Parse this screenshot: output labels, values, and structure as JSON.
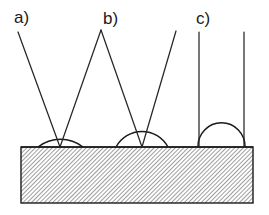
{
  "figure": {
    "background_color": "#ffffff",
    "line_color": "#1a1a1a",
    "hatch_color": "#555555",
    "substrate": {
      "x": 21,
      "y": 147,
      "width": 232,
      "height": 56,
      "hatch_angle_deg": 45,
      "hatch_spacing": 3
    },
    "panels": [
      {
        "id": "a",
        "label": "a)",
        "label_x": 14,
        "label_y": 23,
        "contact_x": 60,
        "contact_y": 147,
        "drop_left_x": 38,
        "drop_right_x": 83,
        "drop_apex_y": 120,
        "contact_angle_deg": 38,
        "ray_left": {
          "x1": 18,
          "y1": 32,
          "x2": 60,
          "y2": 147
        },
        "ray_right": {
          "x1": 101,
          "y1": 30,
          "x2": 60,
          "y2": 147
        }
      },
      {
        "id": "b",
        "label": "b)",
        "label_x": 103,
        "label_y": 24,
        "contact_x": 142,
        "contact_y": 147,
        "drop_left_x": 116,
        "drop_right_x": 168,
        "drop_apex_y": 115,
        "contact_angle_deg": 62,
        "ray_left": {
          "x1": 101,
          "y1": 30,
          "x2": 142,
          "y2": 147
        },
        "ray_right": {
          "x1": 176,
          "y1": 31,
          "x2": 142,
          "y2": 147
        }
      },
      {
        "id": "c",
        "label": "c)",
        "label_x": 196,
        "label_y": 24,
        "contact_x": 221,
        "contact_y": 147,
        "drop_left_x": 198,
        "drop_right_x": 245,
        "drop_apex_y": 112,
        "contact_angle_deg": 92,
        "ray_left": {
          "x1": 199,
          "y1": 32,
          "x2": 199,
          "y2": 147
        },
        "ray_right": {
          "x1": 244,
          "y1": 32,
          "x2": 244,
          "y2": 147
        }
      }
    ]
  }
}
